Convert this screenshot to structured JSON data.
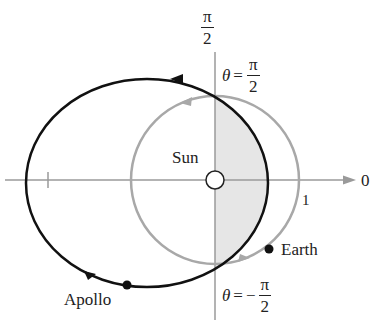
{
  "diagram": {
    "type": "polar orbit diagram",
    "axis_labels": {
      "top": {
        "num": "π",
        "den": "2"
      },
      "right": "0"
    },
    "angle_labels": {
      "upper": {
        "theta": "θ",
        "eq": "=",
        "sign": "",
        "num": "π",
        "den": "2"
      },
      "lower": {
        "theta": "θ",
        "eq": "=",
        "sign": "−",
        "num": "π",
        "den": "2"
      }
    },
    "labels": {
      "sun": "Sun",
      "earth": "Earth",
      "apollo": "Apollo",
      "unit": "1"
    },
    "colors": {
      "axis": "#9a9a9a",
      "earth_orbit": "#a8a8a8",
      "apollo_orbit": "#111111",
      "shaded_region": "#e6e6e6"
    }
  }
}
